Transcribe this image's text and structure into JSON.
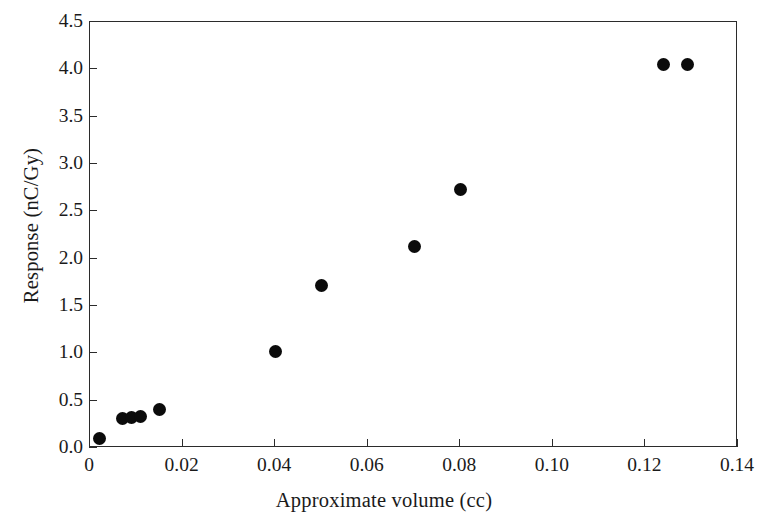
{
  "chart_data": {
    "type": "scatter",
    "title": "",
    "xlabel": "Approximate volume (cc)",
    "ylabel": "Response (nC/Gy)",
    "xlim": [
      0,
      0.14
    ],
    "ylim": [
      0,
      4.5
    ],
    "xticks": [
      0,
      0.02,
      0.04,
      0.06,
      0.08,
      0.1,
      0.12,
      0.14
    ],
    "xtick_labels": [
      "0",
      "0.02",
      "0.04",
      "0.06",
      "0.08",
      "0.10",
      "0.12",
      "0.14"
    ],
    "yticks": [
      0.0,
      0.5,
      1.0,
      1.5,
      2.0,
      2.5,
      3.0,
      3.5,
      4.0,
      4.5
    ],
    "ytick_labels": [
      "0.0",
      "0.5",
      "1.0",
      "1.5",
      "2.0",
      "2.5",
      "3.0",
      "3.5",
      "4.0",
      "4.5"
    ],
    "grid": false,
    "legend": false,
    "marker": "filled-circle",
    "marker_color": "#0b0b0b",
    "marker_size_px": 13,
    "axis_color": "#2b2b2b",
    "background_color": "#ffffff",
    "series": [
      {
        "name": "Chamber response",
        "points": [
          {
            "x": 0.002,
            "y": 0.1
          },
          {
            "x": 0.007,
            "y": 0.31
          },
          {
            "x": 0.009,
            "y": 0.32
          },
          {
            "x": 0.011,
            "y": 0.33
          },
          {
            "x": 0.015,
            "y": 0.41
          },
          {
            "x": 0.04,
            "y": 1.02
          },
          {
            "x": 0.05,
            "y": 1.72
          },
          {
            "x": 0.07,
            "y": 2.13
          },
          {
            "x": 0.08,
            "y": 2.73
          },
          {
            "x": 0.124,
            "y": 4.05
          },
          {
            "x": 0.129,
            "y": 4.05
          }
        ]
      }
    ]
  }
}
